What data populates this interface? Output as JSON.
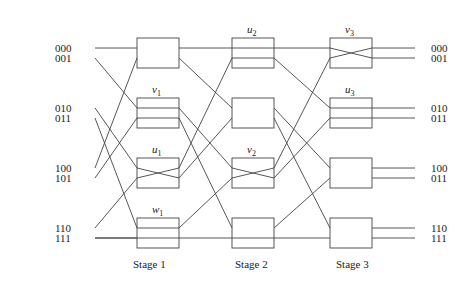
{
  "diagram": {
    "type": "omega-network",
    "inputs": [
      "000",
      "001",
      "010",
      "011",
      "100",
      "101",
      "110",
      "111"
    ],
    "outputs": [
      "000",
      "001",
      "010",
      "011",
      "100",
      "011",
      "110",
      "111"
    ],
    "stages": [
      {
        "label": "Stage 1",
        "switches": [
          {
            "name": "",
            "state": "none"
          },
          {
            "name": "v",
            "sub": "1",
            "state": "straight-three"
          },
          {
            "name": "u",
            "sub": "1",
            "state": "cross"
          },
          {
            "name": "w",
            "sub": "1",
            "state": "straight-top"
          }
        ]
      },
      {
        "label": "Stage 2",
        "switches": [
          {
            "name": "u",
            "sub": "2",
            "state": "straight"
          },
          {
            "name": "",
            "state": "none"
          },
          {
            "name": "v",
            "sub": "2",
            "state": "cross"
          },
          {
            "name": "",
            "state": "none"
          }
        ]
      },
      {
        "label": "Stage 3",
        "switches": [
          {
            "name": "v",
            "sub": "3",
            "state": "cross"
          },
          {
            "name": "u",
            "sub": "3",
            "state": "straight"
          },
          {
            "name": "",
            "state": "none"
          },
          {
            "name": "",
            "state": "none"
          }
        ]
      }
    ]
  }
}
